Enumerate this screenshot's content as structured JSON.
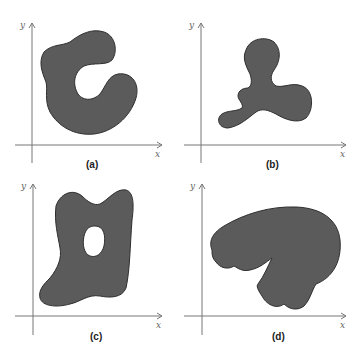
{
  "figure": {
    "colors": {
      "shape_fill": "#5b5b5b",
      "shape_stroke": "#2e2e2e",
      "axis": "#777777"
    },
    "axis_labels": {
      "x": "x",
      "y": "y"
    },
    "panels": [
      {
        "id": "a",
        "label": "(a)",
        "description": "C-shaped region, not simply connected boundary opening to the right"
      },
      {
        "id": "b",
        "label": "(b)",
        "description": "Three-lobed (trefoil-like) simply connected region"
      },
      {
        "id": "c",
        "label": "(c)",
        "description": "Irregular region with an interior hole"
      },
      {
        "id": "d",
        "label": "(d)",
        "description": "Mushroom / cap shaped region with a notch"
      }
    ]
  }
}
